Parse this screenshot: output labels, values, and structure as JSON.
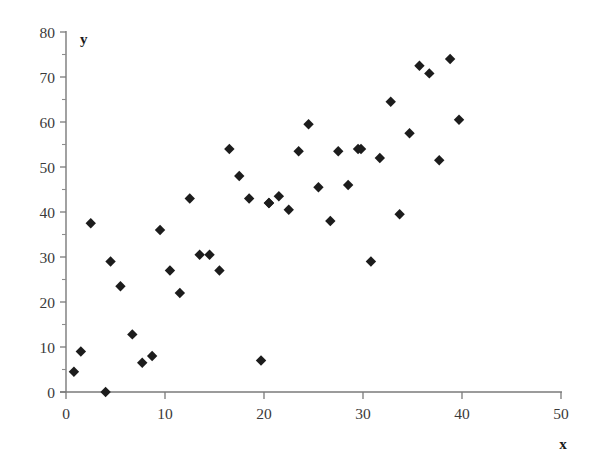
{
  "chart_data": {
    "type": "scatter",
    "title": "",
    "subtitle": "",
    "xlabel": "x",
    "ylabel": "y",
    "xlim": [
      0,
      50
    ],
    "ylim": [
      0,
      80
    ],
    "x_ticks": [
      0,
      10,
      20,
      30,
      40,
      50
    ],
    "x_tick_labels": [
      "0",
      "10",
      "20",
      "30",
      "40",
      "50"
    ],
    "y_ticks": [
      0,
      10,
      20,
      30,
      40,
      50,
      60,
      70,
      80
    ],
    "y_tick_labels": [
      "0",
      "10",
      "20",
      "30",
      "40",
      "50",
      "60",
      "70",
      "80"
    ],
    "x_minor_tick_step": 5,
    "y_minor_tick_step": 5,
    "grid": false,
    "legend": null,
    "legend_position": "none",
    "marker_style": "filled-diamond",
    "marker_color": "#1c1c1c",
    "axis_color": "#7a7a7a",
    "background_color": "#ffffff",
    "n_points": 42,
    "points": [
      [
        0.8,
        4.5
      ],
      [
        1.5,
        9.0
      ],
      [
        2.5,
        37.5
      ],
      [
        4.0,
        0.0
      ],
      [
        4.5,
        29.0
      ],
      [
        5.5,
        23.5
      ],
      [
        6.7,
        12.8
      ],
      [
        7.7,
        6.5
      ],
      [
        8.7,
        8.0
      ],
      [
        9.5,
        36.0
      ],
      [
        10.5,
        27.0
      ],
      [
        11.5,
        22.0
      ],
      [
        12.5,
        43.0
      ],
      [
        13.5,
        30.5
      ],
      [
        14.5,
        30.5
      ],
      [
        15.5,
        27.0
      ],
      [
        16.5,
        54.0
      ],
      [
        17.5,
        48.0
      ],
      [
        18.5,
        43.0
      ],
      [
        19.7,
        7.0
      ],
      [
        20.5,
        42.0
      ],
      [
        21.5,
        43.5
      ],
      [
        22.5,
        40.5
      ],
      [
        23.5,
        53.5
      ],
      [
        24.5,
        59.5
      ],
      [
        25.5,
        45.5
      ],
      [
        26.7,
        38.0
      ],
      [
        27.5,
        53.5
      ],
      [
        28.5,
        46.0
      ],
      [
        29.5,
        54.0
      ],
      [
        30.8,
        29.0
      ],
      [
        31.7,
        52.0
      ],
      [
        32.8,
        64.5
      ],
      [
        33.7,
        39.5
      ],
      [
        34.7,
        57.5
      ],
      [
        35.7,
        72.5
      ],
      [
        36.7,
        70.8
      ],
      [
        37.7,
        51.5
      ],
      [
        38.8,
        74.0
      ],
      [
        39.7,
        60.5
      ],
      [
        20.5,
        42.0
      ],
      [
        29.8,
        54.0
      ]
    ]
  }
}
